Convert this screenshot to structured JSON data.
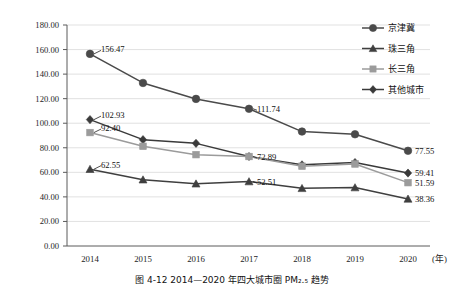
{
  "figure": {
    "caption": "图 4-12  2014—2020 年四大城市圈 PM₂.₅ 趋势",
    "x_unit_label": "(年)"
  },
  "legend": {
    "position": "top-right",
    "items": [
      {
        "label": "京津冀",
        "marker": "circle",
        "color": "#4a4a4a"
      },
      {
        "label": "珠三角",
        "marker": "triangle",
        "color": "#3f3f3f"
      },
      {
        "label": "长三角",
        "marker": "square",
        "color": "#9b9b9b"
      },
      {
        "label": "其他城市",
        "marker": "diamond",
        "color": "#3a3a3a"
      }
    ]
  },
  "axes": {
    "y_ticks": [
      "0.00",
      "20.00",
      "40.00",
      "60.00",
      "80.00",
      "100.00",
      "120.00",
      "140.00",
      "160.00",
      "180.00"
    ],
    "y_min": 0,
    "y_max": 180,
    "y_step": 20,
    "x_ticks": [
      "2014",
      "2015",
      "2016",
      "2017",
      "2018",
      "2019",
      "2020"
    ],
    "grid": "horizontal"
  },
  "chart_data": {
    "type": "line",
    "title": "图 4-12  2014—2020 年四大城市圈 PM₂.₅ 趋势",
    "xlabel": "(年)",
    "ylabel": "",
    "ylim": [
      0,
      180
    ],
    "grid": true,
    "legend_position": "top-right",
    "categories": [
      "2014",
      "2015",
      "2016",
      "2017",
      "2018",
      "2019",
      "2020"
    ],
    "series": [
      {
        "name": "京津冀",
        "marker": "circle",
        "color": "#4a4a4a",
        "values": [
          156.47,
          132.8,
          119.8,
          111.74,
          93.2,
          91.0,
          77.55
        ],
        "labels": {
          "2014": "156.47",
          "2017": "111.74",
          "2020": "77.55"
        }
      },
      {
        "name": "其他城市",
        "marker": "diamond",
        "color": "#3a3a3a",
        "values": [
          102.93,
          86.6,
          83.6,
          72.89,
          66.1,
          68.0,
          59.41
        ],
        "labels": {
          "2014": "102.93",
          "2017": "72.89",
          "2020": "59.41"
        }
      },
      {
        "name": "长三角",
        "marker": "square",
        "color": "#9b9b9b",
        "values": [
          92.4,
          81.2,
          74.4,
          72.89,
          65.0,
          66.8,
          51.59
        ],
        "labels": {
          "2014": "92.40",
          "2020": "51.59"
        }
      },
      {
        "name": "珠三角",
        "marker": "triangle",
        "color": "#3f3f3f",
        "values": [
          62.55,
          54.0,
          50.7,
          52.51,
          47.0,
          47.6,
          38.36
        ],
        "labels": {
          "2014": "62.55",
          "2017": "52.51",
          "2020": "38.36"
        }
      }
    ],
    "data_labels": [
      {
        "series": "京津冀",
        "year": "2014",
        "value": 156.47,
        "text": "156.47"
      },
      {
        "series": "京津冀",
        "year": "2017",
        "value": 111.74,
        "text": "111.74"
      },
      {
        "series": "京津冀",
        "year": "2020",
        "value": 77.55,
        "text": "77.55"
      },
      {
        "series": "其他城市",
        "year": "2014",
        "value": 102.93,
        "text": "102.93"
      },
      {
        "series": "其他城市",
        "year": "2017",
        "value": 72.89,
        "text": "72.89"
      },
      {
        "series": "其他城市",
        "year": "2020",
        "value": 59.41,
        "text": "59.41"
      },
      {
        "series": "长三角",
        "year": "2014",
        "value": 92.4,
        "text": "92.40"
      },
      {
        "series": "长三角",
        "year": "2020",
        "value": 51.59,
        "text": "51.59"
      },
      {
        "series": "珠三角",
        "year": "2014",
        "value": 62.55,
        "text": "62.55"
      },
      {
        "series": "珠三角",
        "year": "2017",
        "value": 52.51,
        "text": "52.51"
      },
      {
        "series": "珠三角",
        "year": "2020",
        "value": 38.36,
        "text": "38.36"
      }
    ]
  }
}
